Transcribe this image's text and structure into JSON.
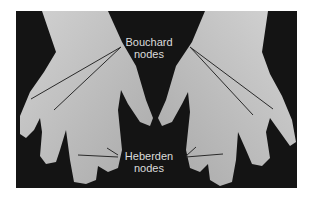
{
  "figure": {
    "labels": {
      "bouchard_line1": "Bouchard",
      "bouchard_line2": "nodes",
      "heberden_line1": "Heberden",
      "heberden_line2": "nodes"
    },
    "colors": {
      "background": "#141414",
      "skin": "#bdbdbd",
      "label_text": "#dcdcdc",
      "pointer_line": "#2a2a2a"
    }
  }
}
